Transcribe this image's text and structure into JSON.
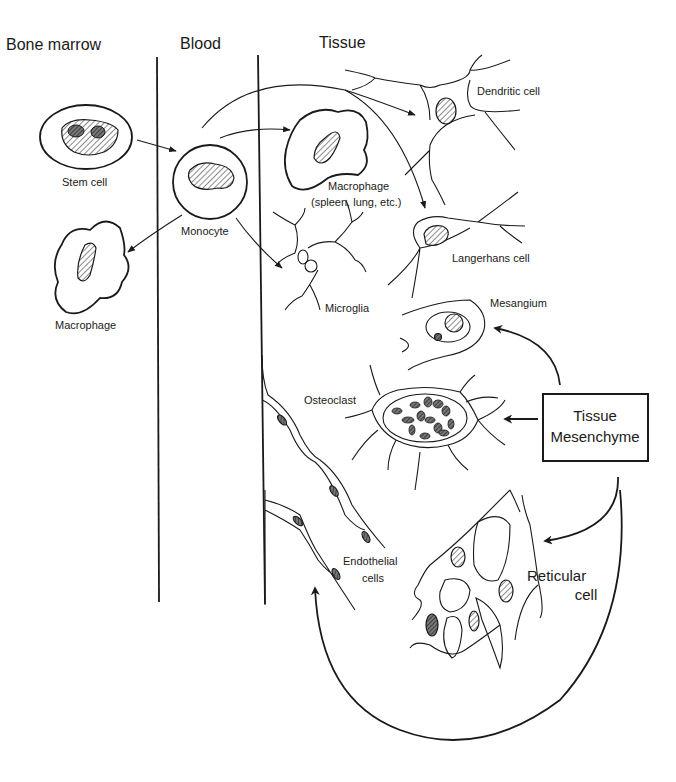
{
  "columns": {
    "bone_marrow": "Bone marrow",
    "blood": "Blood",
    "tissue": "Tissue"
  },
  "cells": {
    "stem_cell": "Stem cell",
    "monocyte": "Monocyte",
    "macrophage_marrow": "Macrophage",
    "macrophage_tissue_line1": "Macrophage",
    "macrophage_tissue_line2": "(spleen, lung, etc.)",
    "dendritic_cell": "Dendritic cell",
    "langerhans_cell": "Langerhans cell",
    "microglia": "Microglia",
    "mesangium": "Mesangium",
    "osteoclast": "Osteoclast",
    "endothelial_line1": "Endothelial",
    "endothelial_line2": "cells",
    "reticular_line1": "Reticular",
    "reticular_line2": "cell"
  },
  "source_box": {
    "line1": "Tissue",
    "line2": "Mesenchyme"
  },
  "colors": {
    "ink": "#1a1a1a",
    "background": "#ffffff"
  }
}
